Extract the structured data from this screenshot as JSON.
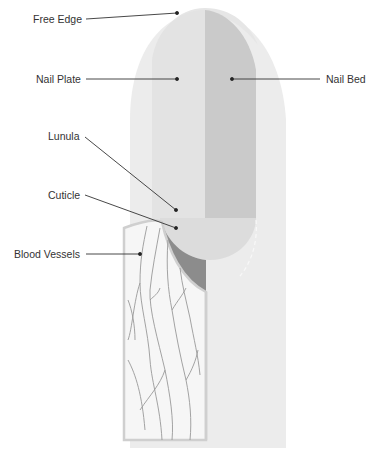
{
  "labels": {
    "free_edge": "Free Edge",
    "nail_plate": "Nail Plate",
    "nail_bed": "Nail Bed",
    "lunula": "Lunula",
    "cuticle": "Cuticle",
    "blood_vessels": "Blood Vessels"
  },
  "colors": {
    "background": "#ffffff",
    "finger_skin": "#ececec",
    "nail_plate": "#e2e2e2",
    "nail_bed": "#c9c9c9",
    "lunula": "#dedede",
    "cuticle_section": "#8a8a8a",
    "vessel_panel": "#f6f6f6",
    "vessel_panel_border": "#cfcfcf",
    "vessel_lines": "#9a9a9a",
    "leader_lines": "#333333",
    "label_text": "#333333"
  }
}
